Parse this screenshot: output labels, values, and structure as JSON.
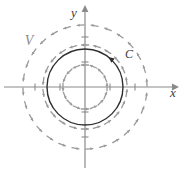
{
  "figure": {
    "background_color": "#ffffff",
    "width": 185,
    "height": 174
  },
  "axes": {
    "origin": {
      "x": 85,
      "y": 87
    },
    "color": "#8a8a8a",
    "tick_spacing": 25,
    "x_axis": {
      "label": "x",
      "label_x": 173,
      "label_y": 97,
      "start_x": 4,
      "end_x": 172,
      "ticks": [
        -2,
        -1,
        1,
        2
      ]
    },
    "y_axis": {
      "label": "y",
      "label_x": 74,
      "label_y": 17,
      "start_y": 168,
      "end_y": 12,
      "ticks": [
        -2,
        -1,
        1,
        2
      ]
    }
  },
  "curve": {
    "name": "C",
    "label": "C",
    "label_x": 129,
    "label_y": 58,
    "radius": 38,
    "color": "#2f2f2f",
    "stroke_width": 1.4,
    "orientation": "counterclockwise",
    "arrow_angle_deg": 52
  },
  "vector_field": {
    "name": "V",
    "label": "V",
    "label_x": 29,
    "label_y": 45,
    "color": "#9a9a9a",
    "stroke_width": 1.3,
    "arrow_length": 7,
    "direction": "counterclockwise",
    "rings": [
      {
        "radius": 22,
        "count": 16,
        "phase_deg": 0
      },
      {
        "radius": 42,
        "count": 22,
        "phase_deg": 8
      },
      {
        "radius": 62,
        "count": 28,
        "phase_deg": 4
      }
    ]
  }
}
